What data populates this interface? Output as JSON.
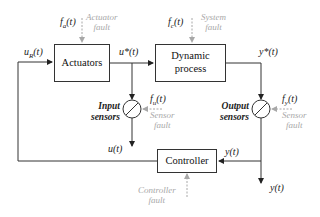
{
  "blocks": {
    "actuators": "Actuators",
    "process_line1": "Dynamic",
    "process_line2": "process",
    "controller": "Controller"
  },
  "signals": {
    "u_r": "u",
    "u_r_sub": "R",
    "u_r_arg": "(t)",
    "u_star": "u*(t)",
    "y_star": "y*(t)",
    "u": "u(t)",
    "y_to_controller": "y(t)",
    "y_out": "y(t)",
    "f_a": "f",
    "f_a_sub": "a",
    "f_a_arg": "(t)",
    "f_c": "f",
    "f_c_sub": "c",
    "f_c_arg": "(t)",
    "f_u": "f",
    "f_u_sub": "u",
    "f_u_arg": "(t)",
    "f_y": "f",
    "f_y_sub": "y",
    "f_y_arg": "(t)"
  },
  "faults": {
    "actuator_l1": "Actuator",
    "actuator_l2": "fault",
    "system_l1": "System",
    "system_l2": "fault",
    "input_sensor_l1": "Sensor",
    "input_sensor_l2": "fault",
    "output_sensor_l1": "Sensor",
    "output_sensor_l2": "fault",
    "controller_l1": "Controller",
    "controller_l2": "fault"
  },
  "sensors": {
    "input_l1": "Input",
    "input_l2": "sensors",
    "output_l1": "Output",
    "output_l2": "sensors"
  },
  "colors": {
    "line": "#333333",
    "fault": "#a8a8a8"
  }
}
